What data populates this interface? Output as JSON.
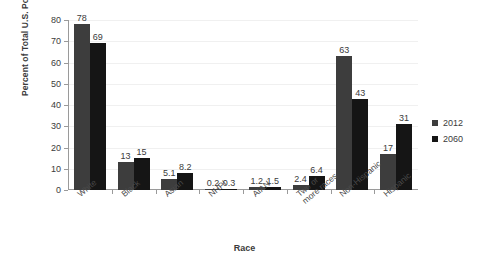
{
  "chart_data": {
    "type": "bar",
    "title": "",
    "xlabel": "Race",
    "ylabel": "Percent of Total U.S. Population",
    "ylim": [
      0,
      80
    ],
    "ytick_step": 10,
    "yticks": [
      "0",
      "10",
      "20",
      "30",
      "40",
      "50",
      "60",
      "70",
      "80"
    ],
    "grid": true,
    "legend_position": "right",
    "categories": [
      "White",
      "Black",
      "Asian",
      "NHPI",
      "AIAN",
      "Two or more races",
      "Non-Hispanic",
      "Hispanic"
    ],
    "category_lines": [
      [
        "White"
      ],
      [
        "Black"
      ],
      [
        "Asian"
      ],
      [
        "NHPI"
      ],
      [
        "AIAN"
      ],
      [
        "Two or",
        "more races"
      ],
      [
        "Non-Hispanic"
      ],
      [
        "Hispanic"
      ]
    ],
    "series": [
      {
        "name": "2012",
        "color": "#3d3d3d",
        "values": [
          78,
          13,
          5.1,
          0.2,
          1.2,
          2.4,
          63,
          17
        ],
        "labels": [
          "78",
          "13",
          "5.1",
          "0.2",
          "1.2",
          "2.4",
          "63",
          "17"
        ]
      },
      {
        "name": "2060",
        "color": "#151515",
        "values": [
          69,
          15,
          8.2,
          0.3,
          1.5,
          6.4,
          43,
          31
        ],
        "labels": [
          "69",
          "15",
          "8.2",
          "0.3",
          "1.5",
          "6.4",
          "43",
          "31"
        ]
      }
    ]
  },
  "legend": {
    "items": [
      {
        "label": "2012",
        "color": "#3d3d3d"
      },
      {
        "label": "2060",
        "color": "#151515"
      }
    ]
  },
  "axes": {
    "x_title": "Race",
    "y_title": "Percent of Total U.S. Population"
  }
}
